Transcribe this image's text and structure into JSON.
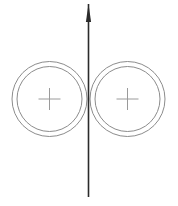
{
  "figure": {
    "canvas": {
      "width": 178,
      "height": 206,
      "background": "#ffffff"
    },
    "colors": {
      "circle_stroke": "#8c8c8c",
      "cross_stroke": "#9a9a9a",
      "axis_stroke": "#2b2b2b"
    },
    "axis": {
      "name": "vertical-axis-arrow",
      "orientation": "vertical",
      "direction": "up",
      "x": 88.5,
      "y_bottom": 197,
      "y_top": 4,
      "stroke_width": 1.6,
      "arrowhead": {
        "tip_x": 88.5,
        "tip_y": 4,
        "base_y": 22,
        "half_width": 2.6
      }
    },
    "circle_groups": [
      {
        "name": "left-circle-group",
        "center_x": 49.5,
        "center_y": 99,
        "outer_radius": 37.5,
        "inner_radius": 32.5,
        "stroke_width": 1.0,
        "marker": {
          "name": "left-center-cross",
          "type": "plus",
          "center_x": 49.5,
          "center_y": 99,
          "arm_length": 11,
          "stroke_width": 1.0
        }
      },
      {
        "name": "right-circle-group",
        "center_x": 127.5,
        "center_y": 99,
        "outer_radius": 37.5,
        "inner_radius": 32.5,
        "stroke_width": 1.0,
        "marker": {
          "name": "right-center-cross",
          "type": "plus",
          "center_x": 127.5,
          "center_y": 99,
          "arm_length": 11,
          "stroke_width": 1.0
        }
      }
    ],
    "labels": []
  }
}
